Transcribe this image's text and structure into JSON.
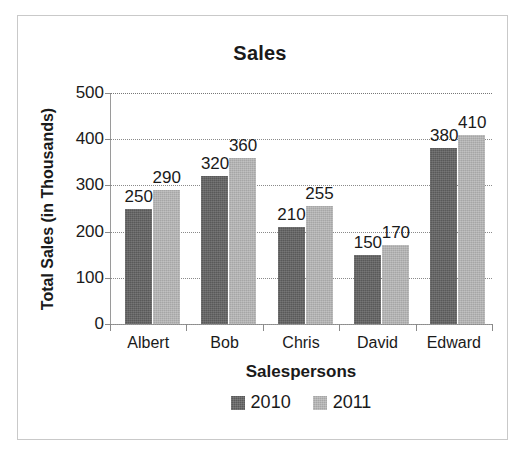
{
  "chart_data": {
    "type": "bar",
    "title": "Sales",
    "xlabel": "Salespersons",
    "ylabel": "Total Sales (in Thousands)",
    "categories": [
      "Albert",
      "Bob",
      "Chris",
      "David",
      "Edward"
    ],
    "series": [
      {
        "name": "2010",
        "color": "#595959",
        "values": [
          250,
          320,
          210,
          150,
          380
        ]
      },
      {
        "name": "2011",
        "color": "#A6A6A6",
        "values": [
          290,
          360,
          255,
          170,
          410
        ]
      }
    ],
    "ylim": [
      0,
      500
    ],
    "y_ticks": [
      500,
      400,
      300,
      200,
      100,
      0
    ],
    "y_tick_labels": [
      "500",
      "400",
      "300",
      "200",
      "100",
      "0"
    ],
    "grid": true,
    "grid_style": "dotted-horizontal",
    "legend_position": "bottom-center",
    "data_labels_shown": true,
    "data_labels": {
      "2010": [
        "250",
        "320",
        "210",
        "150",
        "380"
      ],
      "2011": [
        "290",
        "360",
        "255",
        "170",
        "410"
      ]
    }
  },
  "frame": {
    "border_color": "#C9C9C9",
    "background": "#FFFFFF"
  }
}
